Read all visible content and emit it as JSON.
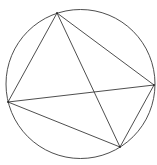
{
  "diagram": {
    "type": "inscribed-quadrilateral",
    "background": "#ffffff",
    "stroke_color": "#3a3a3a",
    "circle": {
      "cx": 80.5,
      "cy": 84,
      "r": 74.5
    },
    "vertices": [
      {
        "id": "top",
        "x": 57,
        "y": 13
      },
      {
        "id": "left",
        "x": 8,
        "y": 102
      },
      {
        "id": "right",
        "x": 154,
        "y": 85
      },
      {
        "id": "bottom",
        "x": 120,
        "y": 147
      }
    ],
    "segments": [
      {
        "from": "top",
        "to": "left"
      },
      {
        "from": "top",
        "to": "right"
      },
      {
        "from": "top",
        "to": "bottom"
      },
      {
        "from": "left",
        "to": "right"
      },
      {
        "from": "left",
        "to": "bottom"
      },
      {
        "from": "right",
        "to": "bottom"
      }
    ],
    "labels": []
  }
}
